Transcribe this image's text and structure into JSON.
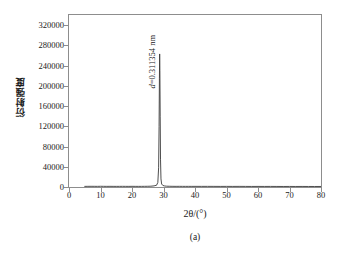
{
  "chart_data": {
    "type": "line",
    "title": "",
    "subtitle": "",
    "xlabel": "2θ/(°)",
    "ylabel": "衍射强度",
    "xlim": [
      0,
      80
    ],
    "ylim": [
      0,
      340000
    ],
    "xticks": [
      0,
      10,
      20,
      30,
      40,
      50,
      60,
      70,
      80
    ],
    "xtick_labels": [
      "0",
      "10",
      "20",
      "30",
      "40",
      "50",
      "60",
      "70",
      "80"
    ],
    "yticks": [
      0,
      40000,
      80000,
      120000,
      160000,
      200000,
      240000,
      280000,
      320000
    ],
    "ytick_labels": [
      "0",
      "40000",
      "80000",
      "120000",
      "160000",
      "200000",
      "240000",
      "280000",
      "320000"
    ],
    "grid": false,
    "legend": null,
    "line_color": "#3a3a3a",
    "frame_color": "#8d8d8d",
    "series": [
      {
        "name": "XRD pattern",
        "x": [
          5.0,
          6.0,
          7.0,
          8.0,
          9.0,
          10.0,
          11.0,
          12.0,
          13.0,
          14.0,
          15.0,
          16.0,
          17.0,
          18.0,
          19.0,
          20.0,
          21.0,
          22.0,
          23.0,
          24.0,
          25.0,
          26.0,
          27.0,
          27.8,
          28.2,
          28.45,
          28.6,
          28.7,
          28.78,
          28.85,
          28.95,
          29.05,
          29.2,
          29.4,
          29.8,
          30.4,
          31.0,
          32.0,
          33.0,
          34.0,
          35.0,
          36.0,
          37.0,
          38.0,
          39.0,
          40.0,
          42.0,
          44.0,
          46.0,
          48.0,
          50.0,
          52.0,
          54.0,
          56.0,
          58.0,
          60.0,
          62.0,
          64.0,
          66.0,
          68.0,
          70.0,
          72.0,
          74.0,
          76.0,
          78.0,
          80.0
        ],
        "y": [
          1200,
          1300,
          1350,
          1300,
          1250,
          1400,
          1300,
          1250,
          1300,
          1250,
          1200,
          1250,
          1300,
          1250,
          1200,
          1300,
          1250,
          1200,
          1250,
          1300,
          1400,
          1600,
          2200,
          3500,
          9000,
          38000,
          120000,
          215000,
          263000,
          230000,
          140000,
          55000,
          16000,
          6000,
          3000,
          2000,
          1600,
          1400,
          1300,
          1250,
          1300,
          1250,
          1200,
          1250,
          1200,
          1250,
          1200,
          1250,
          1200,
          1150,
          1200,
          1150,
          1200,
          1150,
          1100,
          1150,
          1100,
          1150,
          1100,
          1050,
          1100,
          1050,
          1100,
          1050,
          1000,
          1050
        ]
      }
    ],
    "annotations": [
      {
        "name": "d-spacing-label",
        "text": "d=0.311354 nm",
        "italic_prefix": "d",
        "rest": "=0.311354 nm",
        "x": 28.2,
        "y": 300000,
        "rotation": -90
      }
    ],
    "caption": "(a)"
  }
}
